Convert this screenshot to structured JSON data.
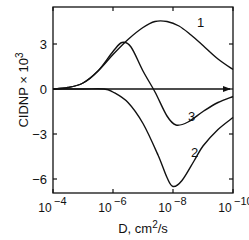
{
  "chart_data": {
    "type": "line",
    "title": "",
    "xlabel": "D, cm²/s",
    "ylabel": "CIDNP × 10³",
    "x_scale": "log (decreasing)",
    "x_ticks": [
      "10^-4",
      "10^-6",
      "10^-8",
      "10^-10"
    ],
    "x_tick_exponents": [
      -4,
      -6,
      -8,
      -10
    ],
    "y_ticks": [
      3,
      0,
      -3,
      -6
    ],
    "ylim": [
      -6.9,
      5.5
    ],
    "xlim_log10": [
      -4,
      -10
    ],
    "grid": false,
    "legend": "curve number labels placed on curves",
    "series": [
      {
        "name": "1",
        "x_log10": [
          -4.0,
          -4.5,
          -5.0,
          -5.5,
          -6.0,
          -6.5,
          -7.0,
          -7.4,
          -7.8,
          -8.2,
          -8.6,
          -9.0,
          -9.5,
          -10.0
        ],
        "values": [
          0.0,
          0.1,
          0.4,
          1.2,
          2.3,
          3.3,
          4.1,
          4.5,
          4.5,
          4.2,
          3.6,
          2.9,
          2.0,
          1.3
        ]
      },
      {
        "name": "2",
        "x_log10": [
          -4.0,
          -5.0,
          -5.7,
          -6.0,
          -6.5,
          -7.0,
          -7.5,
          -7.8,
          -8.0,
          -8.3,
          -8.7,
          -9.0,
          -9.5,
          -10.0
        ],
        "values": [
          0.0,
          0.0,
          0.0,
          -0.2,
          -0.9,
          -2.3,
          -4.4,
          -5.9,
          -6.5,
          -6.1,
          -4.8,
          -3.8,
          -2.7,
          -1.9
        ]
      },
      {
        "name": "3",
        "x_log10": [
          -4.0,
          -4.5,
          -5.0,
          -5.5,
          -6.0,
          -6.3,
          -6.6,
          -7.0,
          -7.4,
          -7.8,
          -8.1,
          -8.5,
          -9.0,
          -9.5,
          -10.0
        ],
        "values": [
          0.0,
          0.1,
          0.4,
          1.2,
          2.5,
          3.1,
          2.8,
          1.2,
          -0.2,
          -1.8,
          -2.4,
          -2.2,
          -1.5,
          -0.9,
          -0.5
        ]
      }
    ],
    "annotations": [
      {
        "text": "1",
        "x_log10": -8.8,
        "y": 4.5
      },
      {
        "text": "3",
        "x_log10": -8.5,
        "y": -1.8
      },
      {
        "text": "2",
        "x_log10": -8.6,
        "y": -4.2
      }
    ]
  },
  "axes": {
    "xlabel_text": "D, cm",
    "xlabel_sup": "2",
    "xlabel_tail": "/s",
    "ylabel_text": "CIDNP × 10",
    "ylabel_sup": "3",
    "tick_base": "10"
  }
}
